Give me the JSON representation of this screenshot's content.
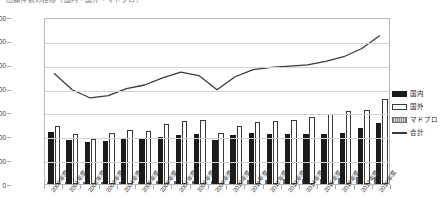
{
  "title_strip": "出願件数の推移（国内・国外・マドプロ）",
  "legend": {
    "position": "right",
    "items": [
      {
        "key": "domestic",
        "label": "国内",
        "icon": "filled-black-bar-swatch",
        "color": "#1b1b1b"
      },
      {
        "key": "overseas",
        "label": "国外",
        "icon": "outline-white-bar-swatch",
        "color": "#ffffff"
      },
      {
        "key": "madopro",
        "label": "マドプロ",
        "icon": "hatched-gray-bar-swatch",
        "color": "#a6a6a6"
      },
      {
        "key": "total",
        "label": "合計",
        "icon": "line-swatch",
        "color": "#3a3a3a"
      }
    ]
  },
  "axis": {
    "y_ticks": [
      "0",
      "10,000",
      "20,000",
      "30,000",
      "40,000",
      "50,000",
      "60,000",
      "70,000"
    ],
    "x_ticks": [
      "2000年度",
      "2001年度",
      "2002年度",
      "2003年度",
      "2004年度",
      "2005年度",
      "2006年度",
      "2007年度",
      "2008年度",
      "2009年度",
      "2010年度",
      "2011年度",
      "2012年度",
      "2013年度",
      "2014年度",
      "2015年度",
      "2016年度",
      "2017年度",
      "2018年度"
    ]
  },
  "chart_data": {
    "type": "bar",
    "title": "出願件数の推移（国内・国外・マドプロ）",
    "xlabel": "",
    "ylabel": "",
    "ylim": [
      0,
      70000
    ],
    "ytick_step": 10000,
    "grid": true,
    "legend_position": "right",
    "categories": [
      "2000年度",
      "2001年度",
      "2002年度",
      "2003年度",
      "2004年度",
      "2005年度",
      "2006年度",
      "2007年度",
      "2008年度",
      "2009年度",
      "2010年度",
      "2011年度",
      "2012年度",
      "2013年度",
      "2014年度",
      "2015年度",
      "2016年度",
      "2017年度",
      "2018年度"
    ],
    "series": [
      {
        "name": "国内",
        "type": "bar",
        "color": "#1b1b1b",
        "values": [
          22000,
          18500,
          17500,
          18200,
          19000,
          19300,
          19500,
          20500,
          21000,
          18500,
          20500,
          21200,
          21000,
          21000,
          21000,
          20800,
          21500,
          23500,
          25500
        ]
      },
      {
        "name": "国外",
        "type": "bar",
        "color": "#ffffff",
        "values": [
          24500,
          21000,
          18800,
          21500,
          22500,
          22300,
          25000,
          26500,
          27000,
          21500,
          24500,
          26000,
          26500,
          27000,
          28000,
          29500,
          30500,
          31000,
          35500
        ]
      },
      {
        "name": "マドプロ",
        "type": "bar",
        "color": "#a6a6a6",
        "values": [
          500,
          600,
          700,
          800,
          900,
          1000,
          1100,
          1200,
          1300,
          1100,
          1300,
          1500,
          1700,
          1900,
          2100,
          2300,
          2500,
          2800,
          3000
        ]
      },
      {
        "name": "合計",
        "type": "line",
        "color": "#3a3a3a",
        "values": [
          47000,
          40000,
          36500,
          37500,
          40500,
          42000,
          45000,
          47500,
          46000,
          40000,
          45500,
          48500,
          49500,
          50000,
          50500,
          52000,
          54000,
          57500,
          63000
        ]
      }
    ]
  }
}
